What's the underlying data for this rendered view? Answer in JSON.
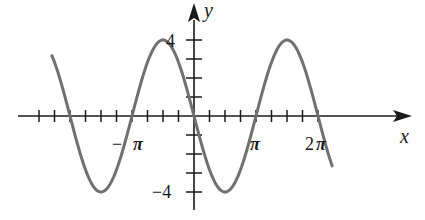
{
  "chart_data": {
    "type": "line",
    "title": "",
    "xlabel": "x",
    "ylabel": "y",
    "function": "y = -4 sin(x)",
    "x_range": [
      -7.2,
      7.0
    ],
    "ylim": [
      -4,
      4
    ],
    "grid": false,
    "legend": null,
    "x_ticks_step": "π/4",
    "x_tick_labels": [
      "−π",
      "π",
      "2π"
    ],
    "y_tick_labels": [
      "4",
      "−4"
    ],
    "y_ticks_step": 1,
    "series": [
      {
        "name": "curve",
        "color": "#707070",
        "x": [
          "-2.25π",
          "-2π",
          "-1.5π",
          "-π",
          "-0.5π",
          "0",
          "0.5π",
          "π",
          "1.5π",
          "2π",
          "2.25π"
        ],
        "values": [
          2.83,
          0,
          -4,
          0,
          4,
          0,
          -4,
          0,
          4,
          0,
          -2.83
        ]
      }
    ],
    "key_points": {
      "maxima": [
        [
          "-π/2",
          4
        ],
        [
          "3π/2",
          4
        ]
      ],
      "minima": [
        [
          "-3π/2",
          -4
        ],
        [
          "π/2",
          -4
        ]
      ],
      "zeros": [
        "-2π",
        "-π",
        "0",
        "π",
        "2π"
      ]
    }
  },
  "labels": {
    "x_axis": "x",
    "y_axis": "y",
    "y_top": "4",
    "y_bottom": "−4",
    "neg_pi_minus": "−",
    "neg_pi": "π",
    "pi": "π",
    "two_pi_coef": "2",
    "two_pi": "π"
  },
  "colors": {
    "axis": "#1a1a1a",
    "curve": "#707070"
  }
}
